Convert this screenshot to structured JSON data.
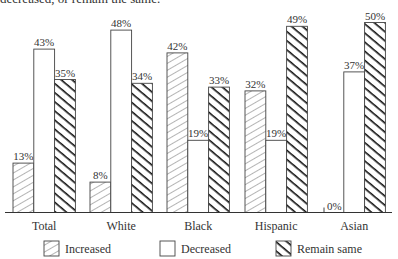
{
  "caption": "decreased, or remain the same.",
  "chart_data": {
    "type": "bar",
    "title": "",
    "xlabel": "",
    "ylabel": "",
    "ylim": [
      0,
      50
    ],
    "grid": false,
    "legend_position": "bottom",
    "categories": [
      "Total",
      "White",
      "Black",
      "Hispanic",
      "Asian"
    ],
    "series": [
      {
        "name": "Increased",
        "pattern": "light-hatch",
        "values": [
          13,
          8,
          42,
          32,
          0
        ]
      },
      {
        "name": "Decreased",
        "pattern": "empty",
        "values": [
          43,
          48,
          19,
          19,
          37
        ]
      },
      {
        "name": "Remain same",
        "pattern": "bold-hatch",
        "values": [
          35,
          34,
          33,
          49,
          50
        ]
      }
    ],
    "value_labels": [
      [
        "13%",
        "8%",
        "42%",
        "32%",
        "0%"
      ],
      [
        "43%",
        "48%",
        "19%",
        "19%",
        "37%"
      ],
      [
        "35%",
        "34%",
        "33%",
        "49%",
        "50%"
      ]
    ]
  },
  "legend": [
    {
      "label": "Increased"
    },
    {
      "label": "Decreased"
    },
    {
      "label": "Remain same"
    }
  ]
}
